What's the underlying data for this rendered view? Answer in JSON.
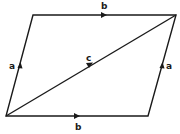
{
  "diagram": {
    "type": "vector parallelogram",
    "stroke_color": "#1a1a1a",
    "vertices": {
      "top_left": [
        33,
        15
      ],
      "top_right": [
        176,
        15
      ],
      "bottom_right": [
        148,
        116
      ],
      "bottom_left": [
        6,
        116
      ]
    },
    "labels": {
      "top": "b",
      "bottom": "b",
      "left": "a",
      "right": "a",
      "diagonal": "c"
    }
  }
}
